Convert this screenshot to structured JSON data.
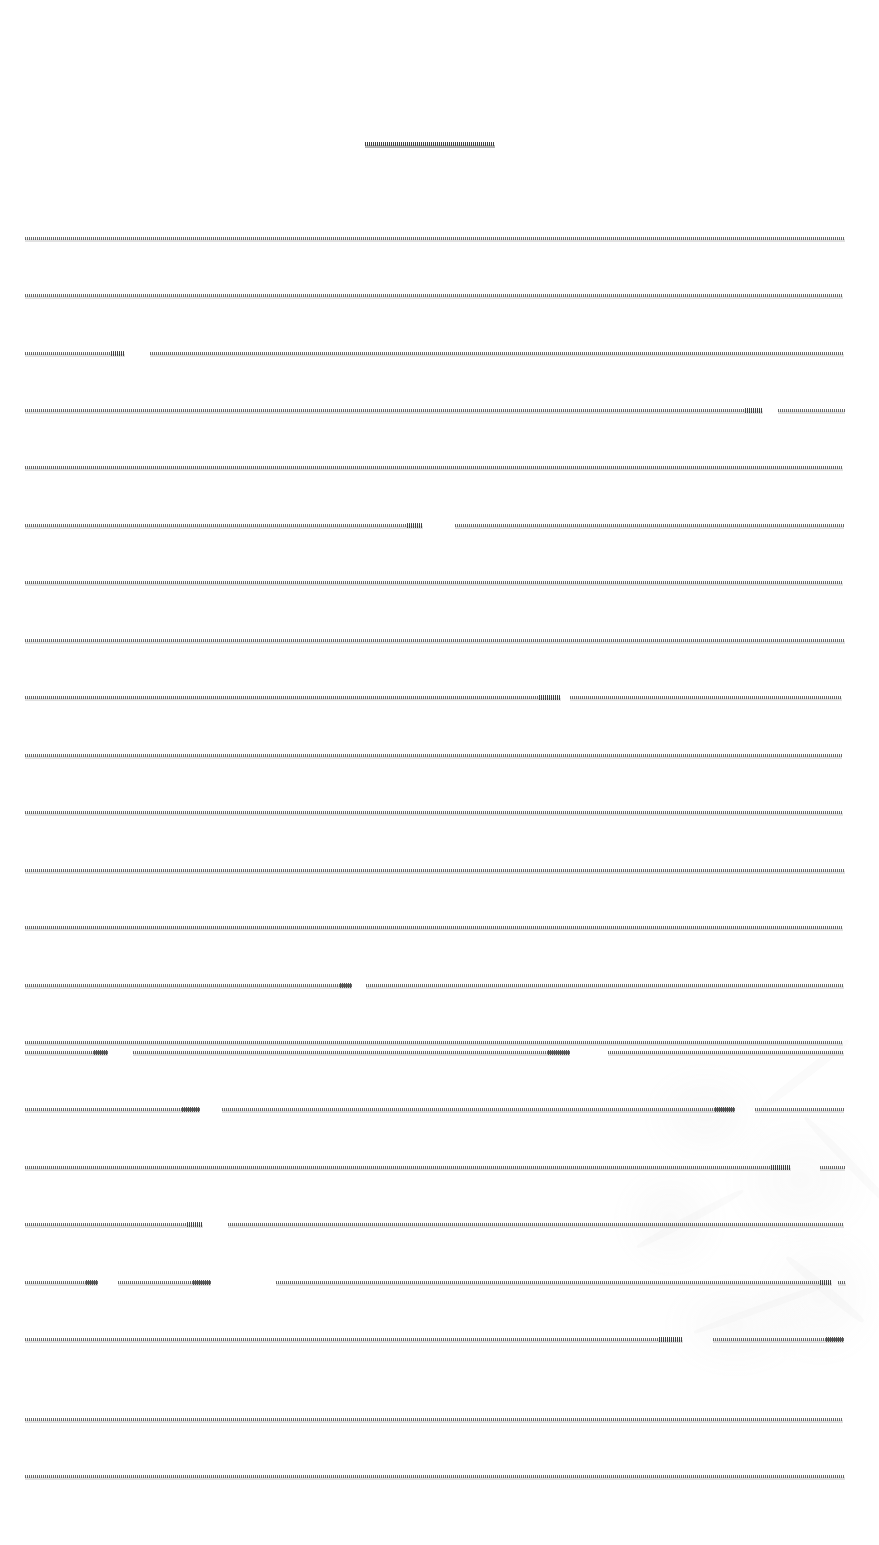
{
  "page": {
    "width": 879,
    "height": 1545,
    "background_color": "#ffffff",
    "ink_color": "#464646",
    "legibility_note": "No text on this page is legible; every line is compressed into a thin horizontal streak.",
    "content_note": "Scanned document page, text illegible"
  },
  "title": {
    "name": "document-title",
    "legible": false,
    "text": "",
    "alt": "illegible centered title streak",
    "y": 138,
    "x_start": 365,
    "x_end": 495,
    "align": "center"
  },
  "body": {
    "name": "body-text-block",
    "legible": false,
    "alt": "illegible justified body text",
    "left_margin": 25,
    "right_margin": 845,
    "first_line_y": 237,
    "line_pitch": 57.5,
    "line_count": 23,
    "justification": "justified",
    "lines": [
      {
        "index": 1,
        "y": 237,
        "runs": [
          {
            "x": 25,
            "w": 820,
            "tail": 0
          }
        ]
      },
      {
        "index": 2,
        "y": 294,
        "runs": [
          {
            "x": 25,
            "w": 818,
            "tail": 0
          }
        ]
      },
      {
        "index": 3,
        "y": 352,
        "runs": [
          {
            "x": 25,
            "w": 100,
            "tail": 14
          },
          {
            "x": 150,
            "w": 694,
            "tail": 0
          }
        ]
      },
      {
        "index": 4,
        "y": 409,
        "runs": [
          {
            "x": 25,
            "w": 738,
            "tail": 18
          },
          {
            "x": 778,
            "w": 67,
            "tail": 0
          }
        ]
      },
      {
        "index": 5,
        "y": 466,
        "runs": [
          {
            "x": 25,
            "w": 818,
            "tail": 0
          }
        ]
      },
      {
        "index": 6,
        "y": 524,
        "runs": [
          {
            "x": 25,
            "w": 398,
            "tail": 16
          },
          {
            "x": 455,
            "w": 389,
            "tail": 0
          }
        ]
      },
      {
        "index": 7,
        "y": 581,
        "runs": [
          {
            "x": 25,
            "w": 818,
            "tail": 0
          }
        ]
      },
      {
        "index": 8,
        "y": 639,
        "runs": [
          {
            "x": 25,
            "w": 820,
            "tail": 0
          }
        ]
      },
      {
        "index": 9,
        "y": 696,
        "runs": [
          {
            "x": 25,
            "w": 536,
            "tail": 22
          },
          {
            "x": 570,
            "w": 272,
            "tail": 0
          }
        ]
      },
      {
        "index": 10,
        "y": 754,
        "runs": [
          {
            "x": 25,
            "w": 817,
            "tail": 0
          }
        ]
      },
      {
        "index": 11,
        "y": 811,
        "runs": [
          {
            "x": 25,
            "w": 818,
            "tail": 0
          }
        ]
      },
      {
        "index": 12,
        "y": 869,
        "runs": [
          {
            "x": 25,
            "w": 820,
            "tail": 0
          }
        ]
      },
      {
        "index": 13,
        "y": 926,
        "runs": [
          {
            "x": 25,
            "w": 818,
            "tail": 0
          }
        ]
      },
      {
        "index": 14,
        "y": 984,
        "runs": [
          {
            "x": 25,
            "w": 327,
            "tail": 12
          },
          {
            "x": 366,
            "w": 478,
            "tail": 0
          }
        ]
      },
      {
        "index": 15,
        "y": 1041,
        "runs": [
          {
            "x": 25,
            "w": 818,
            "tail": 0
          }
        ]
      },
      {
        "index": 16,
        "y": 1050,
        "runs": []
      },
      {
        "index": 17,
        "y": 1051,
        "runs": [
          {
            "x": 25,
            "w": 83,
            "tail": 14
          },
          {
            "x": 133,
            "w": 437,
            "tail": 22
          },
          {
            "x": 608,
            "w": 236,
            "tail": 0
          }
        ]
      },
      {
        "index": 18,
        "y": 1108,
        "runs": [
          {
            "x": 25,
            "w": 175,
            "tail": 18
          },
          {
            "x": 222,
            "w": 513,
            "tail": 20
          },
          {
            "x": 755,
            "w": 89,
            "tail": 0
          }
        ]
      },
      {
        "index": 19,
        "y": 1166,
        "runs": [
          {
            "x": 25,
            "w": 766,
            "tail": 20
          },
          {
            "x": 820,
            "w": 25,
            "tail": 0
          }
        ]
      },
      {
        "index": 20,
        "y": 1223,
        "runs": [
          {
            "x": 25,
            "w": 178,
            "tail": 16
          },
          {
            "x": 228,
            "w": 616,
            "tail": 0
          }
        ]
      },
      {
        "index": 21,
        "y": 1281,
        "runs": [
          {
            "x": 25,
            "w": 73,
            "tail": 12
          },
          {
            "x": 118,
            "w": 93,
            "tail": 18
          },
          {
            "x": 276,
            "w": 556,
            "tail": 12
          },
          {
            "x": 838,
            "w": 8,
            "tail": 0
          }
        ]
      },
      {
        "index": 22,
        "y": 1338,
        "runs": [
          {
            "x": 25,
            "w": 658,
            "tail": 24
          },
          {
            "x": 713,
            "w": 131,
            "tail": 18
          }
        ]
      },
      {
        "index": 23,
        "y": 1418,
        "runs": [
          {
            "x": 25,
            "w": 818,
            "tail": 0
          }
        ]
      },
      {
        "index": 24,
        "y": 1475,
        "runs": [
          {
            "x": 25,
            "w": 820,
            "tail": 0
          }
        ]
      }
    ]
  },
  "artifact": {
    "name": "scan-stain",
    "description": "very faint grey blotches and streaks in the lower-right quadrant",
    "color": "#969696",
    "region": {
      "x": 600,
      "y": 1040,
      "width": 279,
      "height": 330
    }
  }
}
